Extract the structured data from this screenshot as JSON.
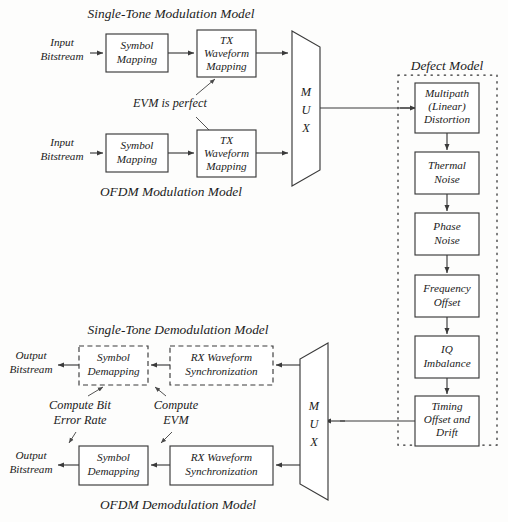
{
  "figure": {
    "sections": {
      "single_tone_modulation": "Single-Tone Modulation Model",
      "ofdm_modulation": "OFDM Modulation Model",
      "defect_model": "Defect Model",
      "single_tone_demodulation": "Single-Tone Demodulation Model",
      "ofdm_demodulation": "OFDM Demodulation Model"
    },
    "notes": {
      "evm_perfect": "EVM is perfect",
      "compute_ber_line1": "Compute Bit",
      "compute_ber_line2": "Error Rate",
      "compute_evm_line1": "Compute",
      "compute_evm_line2": "EVM"
    },
    "io": {
      "input_line1": "Input",
      "input_line2": "Bitstream",
      "output_line1": "Output",
      "output_line2": "Bitstream"
    },
    "mux": {
      "letter_m": "M",
      "letter_u": "U",
      "letter_x": "X"
    },
    "modulation_blocks": {
      "symbol_mapping_line1": "Symbol",
      "symbol_mapping_line2": "Mapping",
      "tx_waveform_line1": "TX",
      "tx_waveform_line2": "Waveform",
      "tx_waveform_line3": "Mapping"
    },
    "demodulation_blocks": {
      "symbol_demapping_line1": "Symbol",
      "symbol_demapping_line2": "Demapping",
      "rx_waveform_line1": "RX Waveform",
      "rx_waveform_line2": "Synchronization"
    },
    "defect_blocks": [
      {
        "id": "multipath",
        "line1": "Multipath",
        "line2": "(Linear)",
        "line3": "Distortion"
      },
      {
        "id": "thermal-noise",
        "line1": "Thermal",
        "line2": "Noise",
        "line3": ""
      },
      {
        "id": "phase-noise",
        "line1": "Phase",
        "line2": "Noise",
        "line3": ""
      },
      {
        "id": "frequency-offset",
        "line1": "Frequency",
        "line2": "Offset",
        "line3": ""
      },
      {
        "id": "iq-imbalance",
        "line1": "IQ",
        "line2": "Imbalance",
        "line3": ""
      },
      {
        "id": "timing-offset",
        "line1": "Timing",
        "line2": "Offset and",
        "line3": "Drift"
      }
    ],
    "colors": {
      "stroke": "#3a3a3a",
      "text": "#1b1b1b",
      "background": "#fdfdfc",
      "dotted_container": "#2f2f2f"
    }
  }
}
